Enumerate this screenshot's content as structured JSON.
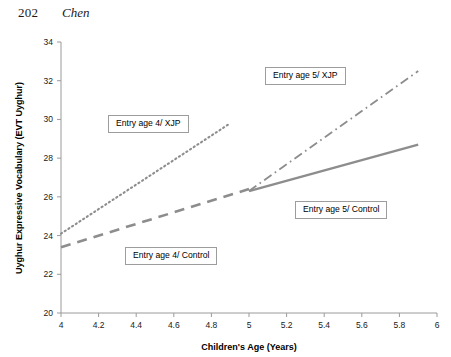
{
  "page": {
    "number": "202",
    "running_head": "Chen"
  },
  "chart_data": {
    "type": "line",
    "title": "",
    "xlabel": "Children's Age (Years)",
    "ylabel": "Uyghur Expressive Vocabulary (EVT Uyghur)",
    "xlim": [
      4,
      6
    ],
    "ylim": [
      20,
      34
    ],
    "xticks": [
      "4",
      "4.2",
      "4.4",
      "4.6",
      "4.8",
      "5",
      "5.2",
      "5.4",
      "5.6",
      "5.8",
      "6"
    ],
    "xtick_values": [
      4,
      4.2,
      4.4,
      4.6,
      4.8,
      5,
      5.2,
      5.4,
      5.6,
      5.8,
      6
    ],
    "yticks": [
      "20",
      "22",
      "24",
      "26",
      "28",
      "30",
      "32",
      "34"
    ],
    "ytick_values": [
      20,
      22,
      24,
      26,
      28,
      30,
      32,
      34
    ],
    "grid": false,
    "legend": "inline-callout-labels",
    "line_color": "#8d8d8d",
    "series": [
      {
        "name": "Entry age 4/ XJP",
        "style": "dotted",
        "x": [
          4.0,
          4.9
        ],
        "values": [
          24.1,
          29.8
        ]
      },
      {
        "name": "Entry age 4/ Control",
        "style": "dashed",
        "x": [
          4.0,
          5.0
        ],
        "values": [
          23.4,
          26.4
        ]
      },
      {
        "name": "Entry age 5/ XJP",
        "style": "dashdot",
        "x": [
          5.0,
          5.9
        ],
        "values": [
          26.3,
          32.5
        ]
      },
      {
        "name": "Entry age 5/ Control",
        "style": "solid",
        "x": [
          5.0,
          5.9
        ],
        "values": [
          26.3,
          28.7
        ]
      }
    ],
    "annotations": [
      {
        "text": "Entry age 4/ XJP",
        "series": 0
      },
      {
        "text": "Entry age 4/ Control",
        "series": 1
      },
      {
        "text": "Entry age 5/ XJP",
        "series": 2
      },
      {
        "text": "Entry age 5/ Control",
        "series": 3
      }
    ]
  }
}
